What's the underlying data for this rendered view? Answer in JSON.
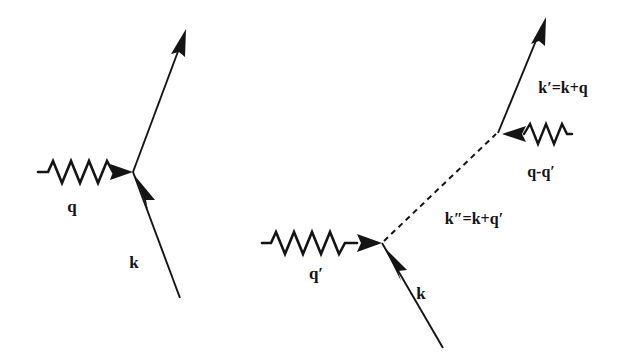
{
  "figure": {
    "kind": "feynman-diagram-pair",
    "background_color": "#ffffff",
    "ink_color": "#141414",
    "width": 620,
    "height": 359
  },
  "diagrams": [
    {
      "id": "first-order-vertex",
      "labels": {
        "photon": "q",
        "incoming_fermion": "k"
      }
    },
    {
      "id": "second-order-vertex",
      "labels": {
        "photon_in": "q′",
        "incoming_fermion": "k",
        "internal_propagator": "k″=k+q′",
        "photon_out": "q-q′",
        "outgoing_fermion": "k′=k+q"
      }
    }
  ]
}
